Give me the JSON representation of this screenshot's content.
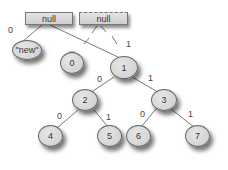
{
  "diagram": {
    "title": "",
    "boxes": [
      {
        "id": "box-1",
        "label": "null"
      },
      {
        "id": "box-2",
        "label": "null"
      }
    ],
    "nodes": [
      {
        "id": "new",
        "label": "\"new\""
      },
      {
        "id": "0",
        "label": "0"
      },
      {
        "id": "1",
        "label": "1"
      },
      {
        "id": "2",
        "label": "2"
      },
      {
        "id": "3",
        "label": "3"
      },
      {
        "id": "4",
        "label": "4"
      },
      {
        "id": "5",
        "label": "5"
      },
      {
        "id": "6",
        "label": "6"
      },
      {
        "id": "7",
        "label": "7"
      }
    ],
    "edges": [
      {
        "from": "box-1",
        "to": "new",
        "label": "0"
      },
      {
        "from": "box-1",
        "to": "1",
        "label": "1"
      },
      {
        "from": "box-2",
        "to": "0",
        "label": ""
      },
      {
        "from": "box-2",
        "to": "1",
        "label": ""
      },
      {
        "from": "1",
        "to": "2",
        "label": "0"
      },
      {
        "from": "1",
        "to": "3",
        "label": "1"
      },
      {
        "from": "2",
        "to": "4",
        "label": "0"
      },
      {
        "from": "2",
        "to": "5",
        "label": "1"
      },
      {
        "from": "3",
        "to": "6",
        "label": "0"
      },
      {
        "from": "3",
        "to": "7",
        "label": "1"
      }
    ],
    "edge_labels": {
      "box1_new": "0",
      "box1_node1": "1",
      "n1_n2": "0",
      "n1_n3": "1",
      "n2_n4": "0",
      "n2_n5": "1",
      "n3_n6": "0",
      "n3_n7": "1"
    },
    "colors": {
      "fill": "#d6d6d6",
      "stroke": "#666666",
      "line": "#555555"
    }
  }
}
